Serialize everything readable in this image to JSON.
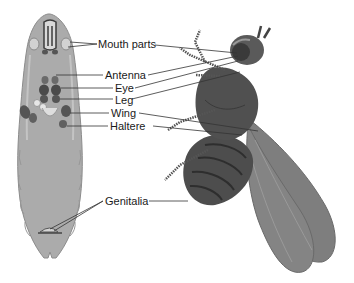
{
  "header": {
    "cut_text": "imaginal discs of larva and corresponding adult structures"
  },
  "labels": {
    "mouth_parts": "Mouth parts",
    "antenna": "Antenna",
    "eye": "Eye",
    "leg": "Leg",
    "wing": "Wing",
    "haltere": "Haltere",
    "genitalia": "Genitalia"
  },
  "figures": {
    "left": "larva",
    "right": "adult-fly"
  },
  "colors": {
    "larva_body": "#a9a9a9",
    "larva_outline": "#8a8a8a",
    "disc_dark": "#4a4a4a",
    "fly_body": "#4d4d4d",
    "wing": "#7d7d7d",
    "leader_line": "#333333"
  }
}
